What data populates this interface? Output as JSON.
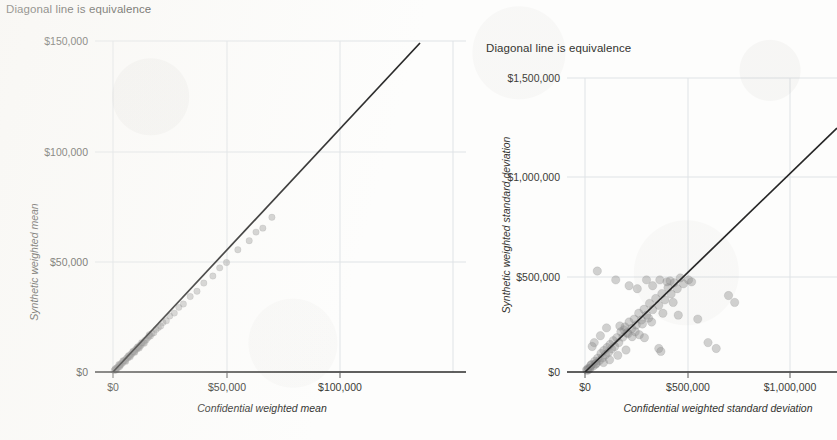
{
  "page": {
    "background_color": "#fdfdfc",
    "text_color": "#33332f",
    "accent_line_color": "#262626",
    "gridline_color": "#dfe3e6",
    "point_color": "#8d8d8d"
  },
  "charts": [
    {
      "id": "confidential-vs-synthetic-mean",
      "chart_data": {
        "type": "scatter",
        "title": "Diagonal line is equivalence",
        "xlabel": "Confidential weighted mean",
        "ylabel": "Synthetic weighted mean",
        "xlim": [
          0,
          135000
        ],
        "ylim": [
          0,
          158000
        ],
        "grid": true,
        "legend": "none",
        "xticks": [
          0,
          50000,
          100000
        ],
        "xtick_labels": [
          "$0",
          "$50,000",
          "$100,000"
        ],
        "yticks": [
          0,
          50000,
          100000,
          150000
        ],
        "ytick_labels": [
          "$0",
          "$50,000",
          "$100,000",
          "$150,000"
        ],
        "reference_line": {
          "label": "Diagonal line is equivalence",
          "type": "identity",
          "slope": 1,
          "intercept": 0,
          "x_start": 0,
          "x_end": 135000
        },
        "points": [
          [
            500,
            700
          ],
          [
            900,
            1100
          ],
          [
            1200,
            1000
          ],
          [
            1600,
            1800
          ],
          [
            2000,
            2200
          ],
          [
            2400,
            2100
          ],
          [
            2800,
            3000
          ],
          [
            3100,
            3300
          ],
          [
            3400,
            3200
          ],
          [
            3800,
            4100
          ],
          [
            4200,
            4000
          ],
          [
            4600,
            4900
          ],
          [
            5000,
            5200
          ],
          [
            5400,
            5100
          ],
          [
            5800,
            6000
          ],
          [
            6200,
            6500
          ],
          [
            6600,
            6400
          ],
          [
            7000,
            7300
          ],
          [
            7400,
            7200
          ],
          [
            7800,
            8100
          ],
          [
            8200,
            8000
          ],
          [
            8600,
            8900
          ],
          [
            9000,
            9200
          ],
          [
            9400,
            9100
          ],
          [
            9800,
            10000
          ],
          [
            10200,
            10500
          ],
          [
            10600,
            10400
          ],
          [
            11000,
            11300
          ],
          [
            11400,
            11200
          ],
          [
            11800,
            12100
          ],
          [
            12300,
            12000
          ],
          [
            12800,
            13100
          ],
          [
            13400,
            13200
          ],
          [
            14000,
            14300
          ],
          [
            14600,
            14500
          ],
          [
            15200,
            15400
          ],
          [
            15900,
            16200
          ],
          [
            16500,
            16300
          ],
          [
            17200,
            17500
          ],
          [
            18000,
            17800
          ],
          [
            19000,
            19300
          ],
          [
            20000,
            20200
          ],
          [
            21000,
            20800
          ],
          [
            22000,
            22400
          ],
          [
            23500,
            23200
          ],
          [
            25000,
            25400
          ],
          [
            27000,
            26700
          ],
          [
            29000,
            29300
          ],
          [
            31000,
            30800
          ],
          [
            34000,
            34200
          ],
          [
            37000,
            36600
          ],
          [
            40000,
            40300
          ],
          [
            44000,
            43500
          ],
          [
            47000,
            47200
          ],
          [
            50000,
            49600
          ],
          [
            55000,
            55400
          ],
          [
            60000,
            59500
          ],
          [
            63000,
            63400
          ],
          [
            66000,
            65200
          ],
          [
            70000,
            70100
          ],
          [
            1000,
            1500
          ],
          [
            1400,
            900
          ],
          [
            2600,
            3400
          ],
          [
            3000,
            2500
          ],
          [
            4400,
            5100
          ],
          [
            5600,
            4800
          ],
          [
            6800,
            7400
          ],
          [
            7600,
            6900
          ],
          [
            8800,
            9400
          ],
          [
            9600,
            8900
          ],
          [
            10800,
            11400
          ],
          [
            11600,
            10900
          ],
          [
            12600,
            13300
          ],
          [
            13800,
            13000
          ],
          [
            16000,
            16900
          ]
        ]
      }
    },
    {
      "id": "confidential-vs-synthetic-stddev",
      "chart_data": {
        "type": "scatter",
        "title": "Diagonal line is equivalence",
        "xlabel": "Confidential weighted standard deviation",
        "ylabel": "Synthetic weighted standard deviation",
        "xlim": [
          0,
          1230000
        ],
        "ylim": [
          0,
          1580000
        ],
        "grid": true,
        "legend": "none",
        "xticks": [
          0,
          500000,
          1000000
        ],
        "xtick_labels": [
          "$0",
          "$500,000",
          "$1,000,000"
        ],
        "yticks": [
          0,
          500000,
          1000000,
          1500000
        ],
        "ytick_labels": [
          "$0",
          "$500,000",
          "$1,000,000",
          "$1,500,000"
        ],
        "reference_line": {
          "label": "Diagonal line is equivalence",
          "type": "identity",
          "slope": 1,
          "intercept": 0,
          "x_start": 0,
          "x_end": 1230000
        },
        "points": [
          [
            15000,
            18000
          ],
          [
            25000,
            20000
          ],
          [
            32000,
            38000
          ],
          [
            40000,
            30000
          ],
          [
            48000,
            55000
          ],
          [
            55000,
            45000
          ],
          [
            62000,
            70000
          ],
          [
            70000,
            58000
          ],
          [
            78000,
            95000
          ],
          [
            85000,
            72000
          ],
          [
            92000,
            110000
          ],
          [
            100000,
            88000
          ],
          [
            108000,
            125000
          ],
          [
            115000,
            100000
          ],
          [
            122000,
            140000
          ],
          [
            130000,
            118000
          ],
          [
            138000,
            160000
          ],
          [
            145000,
            130000
          ],
          [
            60000,
            515000
          ],
          [
            155000,
            175000
          ],
          [
            165000,
            150000
          ],
          [
            175000,
            205000
          ],
          [
            185000,
            178000
          ],
          [
            150000,
            470000
          ],
          [
            195000,
            230000
          ],
          [
            205000,
            200000
          ],
          [
            215000,
            255000
          ],
          [
            228000,
            222000
          ],
          [
            240000,
            270000
          ],
          [
            250000,
            240000
          ],
          [
            215000,
            440000
          ],
          [
            262000,
            300000
          ],
          [
            275000,
            265000
          ],
          [
            288000,
            320000
          ],
          [
            300000,
            290000
          ],
          [
            255000,
            425000
          ],
          [
            315000,
            350000
          ],
          [
            330000,
            318000
          ],
          [
            345000,
            375000
          ],
          [
            360000,
            340000
          ],
          [
            300000,
            470000
          ],
          [
            375000,
            400000
          ],
          [
            390000,
            368000
          ],
          [
            405000,
            430000
          ],
          [
            325000,
            255000
          ],
          [
            420000,
            398000
          ],
          [
            435000,
            455000
          ],
          [
            330000,
            440000
          ],
          [
            365000,
            470000
          ],
          [
            450000,
            425000
          ],
          [
            465000,
            480000
          ],
          [
            400000,
            460000
          ],
          [
            480000,
            450000
          ],
          [
            415000,
            465000
          ],
          [
            190000,
            215000
          ],
          [
            210000,
            195000
          ],
          [
            230000,
            180000
          ],
          [
            170000,
            235000
          ],
          [
            280000,
            245000
          ],
          [
            245000,
            205000
          ],
          [
            265000,
            190000
          ],
          [
            310000,
            275000
          ],
          [
            290000,
            175000
          ],
          [
            430000,
            355000
          ],
          [
            380000,
            300000
          ],
          [
            455000,
            290000
          ],
          [
            360000,
            120000
          ],
          [
            370000,
            105000
          ],
          [
            505000,
            470000
          ],
          [
            520000,
            460000
          ],
          [
            700000,
            390000
          ],
          [
            730000,
            355000
          ],
          [
            550000,
            270000
          ],
          [
            600000,
            150000
          ],
          [
            640000,
            120000
          ],
          [
            90000,
            48000
          ],
          [
            120000,
            62000
          ],
          [
            160000,
            85000
          ],
          [
            200000,
            112000
          ],
          [
            35000,
            130000
          ],
          [
            45000,
            150000
          ],
          [
            75000,
            185000
          ],
          [
            105000,
            225000
          ],
          [
            12000,
            9000
          ],
          [
            8000,
            11000
          ],
          [
            20000,
            14000
          ],
          [
            28000,
            33000
          ],
          [
            52000,
            40000
          ]
        ]
      }
    }
  ]
}
